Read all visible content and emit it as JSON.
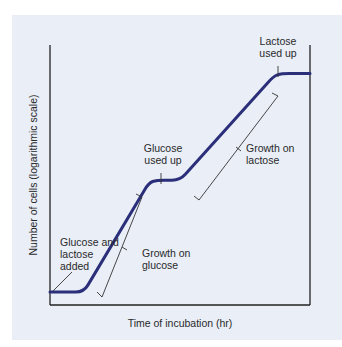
{
  "chart_data": {
    "type": "line",
    "title": "",
    "xlabel": "Time of incubation (hr)",
    "ylabel": "Number of cells (logarithmic scale)",
    "xlim": [
      0,
      100
    ],
    "ylim": [
      0,
      100
    ],
    "grid": false,
    "series": [
      {
        "name": "Diauxic growth curve",
        "color": "#2b2f7a",
        "x": [
          0,
          13,
          38,
          41,
          50,
          86,
          89,
          100
        ],
        "y": [
          5,
          5,
          47,
          48,
          48,
          88,
          89,
          89
        ]
      }
    ],
    "annotations": [
      {
        "id": "glucose-lactose-added",
        "lines": [
          "Glucose and",
          "lactose",
          "added"
        ]
      },
      {
        "id": "growth-on-glucose",
        "lines": [
          "Growth on",
          "glucose"
        ]
      },
      {
        "id": "glucose-used-up",
        "lines": [
          "Glucose",
          "used up"
        ]
      },
      {
        "id": "growth-on-lactose",
        "lines": [
          "Growth on",
          "lactose"
        ]
      },
      {
        "id": "lactose-used-up",
        "lines": [
          "Lactose",
          "used up"
        ]
      }
    ]
  },
  "colors": {
    "panel": "#e9eef7",
    "curve": "#2b2f7a",
    "axis": "#222222",
    "bracket": "#333333"
  }
}
